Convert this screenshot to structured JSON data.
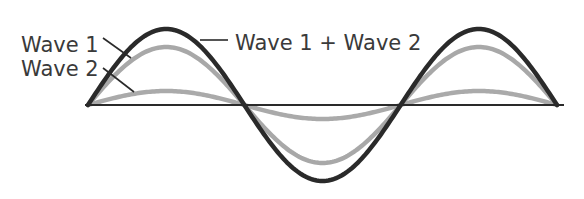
{
  "figure": {
    "width": 584,
    "height": 199,
    "background": "#ffffff",
    "axis": {
      "y": 105,
      "x_start": 85,
      "x_end": 564,
      "color": "#2a2a2a",
      "stroke_width": 2
    },
    "waves": {
      "x_start": 88,
      "x_end": 557,
      "cycles": 1.5,
      "series": [
        {
          "name": "Wave 2",
          "amplitude": 14,
          "color": "#aaaaaa",
          "stroke_width": 4.5
        },
        {
          "name": "Wave 1",
          "amplitude": 58,
          "color": "#a8a8a8",
          "stroke_width": 4.5
        },
        {
          "name": "Wave 1 + Wave 2",
          "amplitude": 76,
          "color": "#2a2a2a",
          "stroke_width": 4.5
        }
      ]
    },
    "labels": {
      "wave1": {
        "text": "Wave 1",
        "x": 21,
        "y": 52,
        "leader": [
          103,
          38,
          131,
          58
        ]
      },
      "wave2": {
        "text": "Wave 2",
        "x": 21,
        "y": 76,
        "leader": [
          103,
          68,
          134,
          92
        ]
      },
      "sum": {
        "text": "Wave 1 + Wave 2",
        "x": 235,
        "y": 50,
        "leader": [
          200,
          40,
          228,
          40
        ]
      }
    },
    "leader_color": "#2a2a2a"
  },
  "chart_data": {
    "type": "line",
    "title": "",
    "xlabel": "",
    "ylabel": "",
    "x": [
      0,
      0.25,
      0.5,
      0.75,
      1.0,
      1.25,
      1.5
    ],
    "series": [
      {
        "name": "Wave 1",
        "values": [
          0,
          58,
          0,
          -58,
          0,
          58,
          0
        ]
      },
      {
        "name": "Wave 2",
        "values": [
          0,
          14,
          0,
          -14,
          0,
          14,
          0
        ]
      },
      {
        "name": "Wave 1 + Wave 2",
        "values": [
          0,
          76,
          0,
          -76,
          0,
          76,
          0
        ]
      }
    ],
    "legend": [
      "Wave 1",
      "Wave 2",
      "Wave 1 + Wave 2"
    ],
    "grid": false
  }
}
